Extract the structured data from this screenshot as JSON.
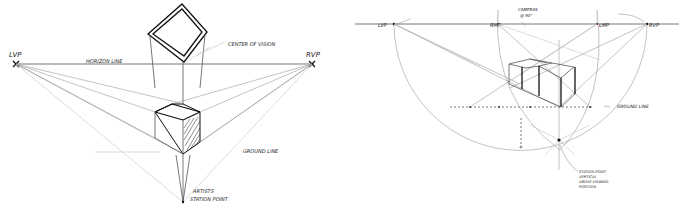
{
  "left_diagram": {
    "labels": {
      "lvp": "LVP",
      "rvp": "RVP",
      "horizon": "HORIZON LINE",
      "center_of_vision": "CENTER OF VISION",
      "ground_line": "GROUND LINE",
      "station_point_1": "ARTISTS",
      "station_point_2": "STATION POINT"
    }
  },
  "right_diagram": {
    "labels": {
      "lvp": "LVP",
      "rmp": "RMP",
      "lmp": "LMP",
      "rvp": "RVP",
      "cameras_1": "CAMERAS",
      "cameras_2": "@ 90°",
      "ground_line": "GROUND LINE",
      "station_note_1": "STATION POINT",
      "station_note_2": "VERTICAL",
      "station_note_3": "ABOVE VIEWING",
      "station_note_4": "POSITION"
    }
  }
}
